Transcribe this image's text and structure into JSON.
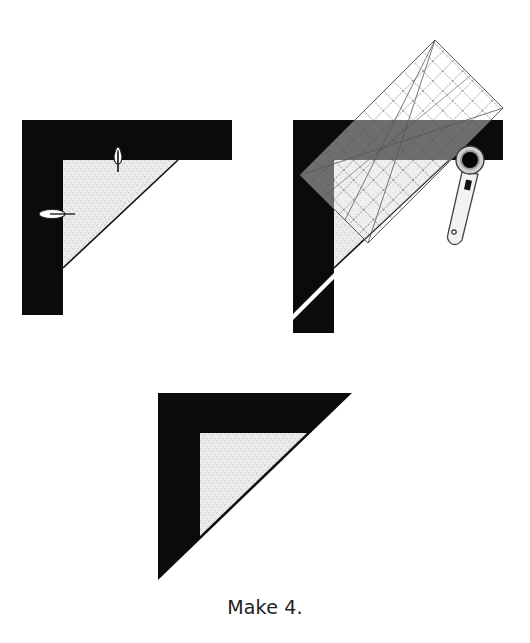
{
  "diagram": {
    "type": "quilting-instruction-steps",
    "colors": {
      "dark_fabric": "#0b0b0b",
      "light_fabric": "#ececec",
      "speckle": "#9a9a9a",
      "ruler_overlay_on_dark": "#6e6e6e",
      "ruler_grid_line": "#555555",
      "cutter_handle": "#f2f2f2",
      "cutter_outline": "#444444",
      "background": "#ffffff"
    },
    "steps": [
      {
        "id": "step-1",
        "description": "Dark L-shaped border strips pinned to light speckled triangle",
        "elements": [
          "dark-l-border",
          "light-speckled-triangle",
          "pin-top",
          "pin-left"
        ]
      },
      {
        "id": "step-2",
        "description": "Square ruler placed diagonally; rotary cutter trims excess along triangle edge",
        "elements": [
          "dark-l-border",
          "light-speckled-triangle",
          "square-ruler-grid",
          "rotary-cutter",
          "trimmed-strip-end"
        ]
      },
      {
        "id": "step-3",
        "description": "Finished pieced triangle unit",
        "elements": [
          "finished-dark-triangle",
          "light-speckled-triangle"
        ]
      }
    ],
    "caption": "Make 4."
  }
}
